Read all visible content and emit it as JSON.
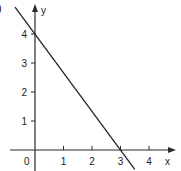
{
  "figure_label_fragment": ")",
  "chart_data": {
    "type": "line",
    "title": "",
    "xlabel": "x",
    "ylabel": "y",
    "origin_label": "0",
    "xlim": [
      0,
      4.9
    ],
    "ylim": [
      -0.7,
      5
    ],
    "x_ticks": [
      1,
      2,
      3,
      4
    ],
    "x_tick_labels": [
      "1",
      "2",
      "3",
      "4"
    ],
    "y_ticks": [
      1,
      2,
      3,
      4
    ],
    "y_tick_labels": [
      "1",
      "2",
      "3",
      "4"
    ],
    "grid": false,
    "series": [
      {
        "name": "line",
        "equation": "4x + 3y = 12",
        "points": [
          [
            -0.7,
            4.93
          ],
          [
            3.5,
            -0.67
          ]
        ],
        "x_intercept": 3,
        "y_intercept": 4,
        "color": "#222222"
      }
    ]
  }
}
